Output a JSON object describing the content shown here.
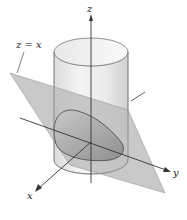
{
  "figure": {
    "type": "3d-surface-diagram",
    "labels": {
      "plane": "z = x",
      "z_axis": "z",
      "y_axis": "y",
      "x_axis": "x"
    },
    "colors": {
      "background": "#ffffff",
      "cylinder_fill": "#ececec",
      "cylinder_shade": "#d4d4d4",
      "plane_fill": "#b9b9b9",
      "cut_region": "#a8a8a8",
      "axis": "#333333",
      "outline": "#555555"
    }
  }
}
